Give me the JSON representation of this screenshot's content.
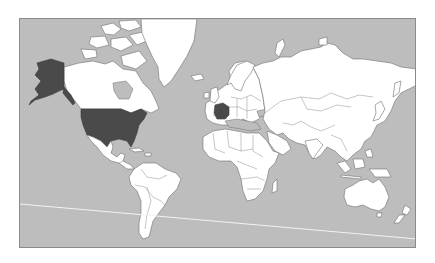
{
  "map": {
    "projection": "mercator",
    "style": "grayscale world political map",
    "colors": {
      "ocean": "#bdbdbd",
      "land": "#ffffff",
      "highlight": "#4a4a4a",
      "border": "#6e6e6e",
      "frame": "#8a8a8a",
      "line": "#f2f2f2"
    },
    "highlighted_countries": [
      "United States (incl. Alaska)",
      "France"
    ],
    "annotations": [
      {
        "type": "line",
        "description": "thin white line crossing southern ocean from west to east"
      }
    ]
  }
}
